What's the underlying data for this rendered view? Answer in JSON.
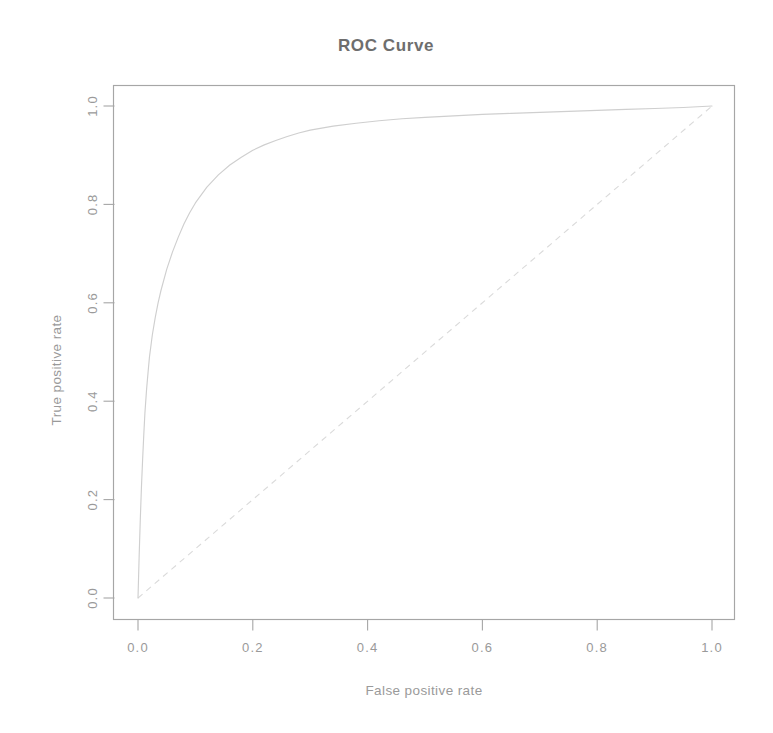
{
  "figure": {
    "title": "ROC Curve",
    "background_color": "#ffffff",
    "width": 773,
    "height": 733
  },
  "axes": {
    "x_label": "False positive rate",
    "y_label": "True positive rate",
    "x_ticks": [
      "0.0",
      "0.2",
      "0.4",
      "0.6",
      "0.8",
      "1.0"
    ],
    "y_ticks": [
      "0.0",
      "0.2",
      "0.4",
      "0.6",
      "0.8",
      "1.0"
    ],
    "box_color": "#a6a6a6",
    "tick_label_color": "#9a9a9a"
  },
  "chart_data": {
    "type": "line",
    "title": "ROC Curve",
    "xlabel": "False positive rate",
    "ylabel": "True positive rate",
    "xlim": [
      0.0,
      1.0
    ],
    "ylim": [
      0.0,
      1.0
    ],
    "grid": false,
    "legend": "none",
    "xticks": [
      0.0,
      0.2,
      0.4,
      0.6,
      0.8,
      1.0
    ],
    "yticks": [
      0.0,
      0.2,
      0.4,
      0.6,
      0.8,
      1.0
    ],
    "series": [
      {
        "name": "ROC curve",
        "style": "solid",
        "color": "#cfcfcf",
        "x": [
          0.0,
          0.002,
          0.004,
          0.006,
          0.008,
          0.01,
          0.012,
          0.015,
          0.018,
          0.02,
          0.025,
          0.03,
          0.035,
          0.04,
          0.05,
          0.06,
          0.07,
          0.08,
          0.09,
          0.1,
          0.12,
          0.14,
          0.16,
          0.18,
          0.2,
          0.22,
          0.24,
          0.26,
          0.28,
          0.3,
          0.34,
          0.38,
          0.42,
          0.46,
          0.5,
          0.55,
          0.6,
          0.65,
          0.7,
          0.75,
          0.8,
          0.85,
          0.9,
          0.95,
          1.0
        ],
        "y": [
          0.0,
          0.085,
          0.16,
          0.225,
          0.28,
          0.33,
          0.375,
          0.425,
          0.465,
          0.49,
          0.535,
          0.57,
          0.6,
          0.625,
          0.668,
          0.703,
          0.733,
          0.76,
          0.783,
          0.803,
          0.835,
          0.86,
          0.88,
          0.896,
          0.91,
          0.921,
          0.93,
          0.938,
          0.945,
          0.951,
          0.959,
          0.965,
          0.97,
          0.974,
          0.977,
          0.98,
          0.983,
          0.985,
          0.987,
          0.989,
          0.991,
          0.993,
          0.995,
          0.997,
          1.0
        ]
      },
      {
        "name": "Chance reference line",
        "style": "dashed",
        "color": "#dadada",
        "x": [
          0.0,
          1.0
        ],
        "y": [
          0.0,
          1.0
        ]
      }
    ]
  }
}
